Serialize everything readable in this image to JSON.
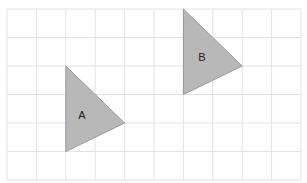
{
  "grid": {
    "x0": 7,
    "y0": 9,
    "cols": 10,
    "rows": 6,
    "cell_w": 29.4,
    "cell_h": 28.5,
    "line_color": "#e2e2e2"
  },
  "shapes": [
    {
      "label": "A",
      "points": [
        [
          2,
          2
        ],
        [
          2,
          5
        ],
        [
          4,
          4
        ]
      ],
      "fill": "#b8b8b8",
      "stroke": "#9a9a9a",
      "label_pos": [
        82,
        115
      ]
    },
    {
      "label": "B",
      "points": [
        [
          6,
          0
        ],
        [
          6,
          3
        ],
        [
          8,
          2
        ]
      ],
      "fill": "#b8b8b8",
      "stroke": "#9a9a9a",
      "label_pos": [
        202,
        57
      ]
    }
  ]
}
